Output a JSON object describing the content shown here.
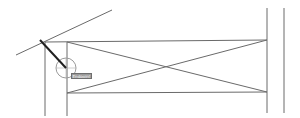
{
  "drawing": {
    "line_color": "#6a6a6a",
    "selected_line_color": "#202020",
    "snap_circle_color": "#9a9a9a",
    "lines": [
      {
        "name": "construction-line",
        "x1": 16,
        "y1": 55,
        "x2": 112,
        "y2": 10
      },
      {
        "name": "left-outer-vertical",
        "x1": 45,
        "y1": 42,
        "x2": 45,
        "y2": 116
      },
      {
        "name": "left-inner-vertical",
        "x1": 67,
        "y1": 42,
        "x2": 67,
        "y2": 116
      },
      {
        "name": "top-horizontal",
        "x1": 45,
        "y1": 42,
        "x2": 267,
        "y2": 40
      },
      {
        "name": "bottom-horizontal",
        "x1": 67,
        "y1": 93,
        "x2": 267,
        "y2": 92
      },
      {
        "name": "diagonal-down",
        "x1": 67,
        "y1": 42,
        "x2": 267,
        "y2": 92
      },
      {
        "name": "diagonal-up",
        "x1": 67,
        "y1": 93,
        "x2": 267,
        "y2": 40
      },
      {
        "name": "right-inner-vertical",
        "x1": 267,
        "y1": 8,
        "x2": 267,
        "y2": 113
      },
      {
        "name": "right-outer-vertical",
        "x1": 284,
        "y1": 8,
        "x2": 284,
        "y2": 113
      }
    ],
    "selected_line": {
      "x1": 40,
      "y1": 40,
      "x2": 66,
      "y2": 68
    },
    "snap_marker": {
      "cx": 66,
      "cy": 68,
      "r": 10
    },
    "snap_tooltip": "Endpoint"
  }
}
